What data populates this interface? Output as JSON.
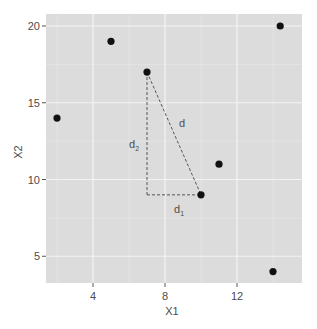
{
  "chart_data": {
    "type": "scatter",
    "title": "",
    "xlabel": "X1",
    "ylabel": "X2",
    "xlim": [
      1.4,
      14.6
    ],
    "ylim": [
      3.4,
      20.8
    ],
    "x_ticks": [
      4,
      8,
      12
    ],
    "y_ticks": [
      5,
      10,
      15,
      20
    ],
    "grid": true,
    "legend": null,
    "points": [
      {
        "x": 2,
        "y": 14
      },
      {
        "x": 5,
        "y": 19
      },
      {
        "x": 7,
        "y": 17
      },
      {
        "x": 10,
        "y": 9
      },
      {
        "x": 11,
        "y": 11
      },
      {
        "x": 14,
        "y": 4
      },
      {
        "x": 14.4,
        "y": 20
      }
    ],
    "annotations": [
      {
        "type": "dashed-line",
        "from": [
          7,
          17
        ],
        "to": [
          10,
          9
        ],
        "label": "d"
      },
      {
        "type": "dashed-line",
        "from": [
          7,
          17
        ],
        "to": [
          7,
          9
        ],
        "label": "d2"
      },
      {
        "type": "dashed-line",
        "from": [
          7,
          9
        ],
        "to": [
          10,
          9
        ],
        "label": "d1"
      }
    ]
  },
  "labels": {
    "x_axis": "X1",
    "y_axis": "X2",
    "x_ticks": [
      "4",
      "8",
      "12"
    ],
    "y_ticks": [
      "5",
      "10",
      "15",
      "20"
    ],
    "d": "d",
    "d1_main": "d",
    "d1_sub": "1",
    "d2_main": "d",
    "d2_sub": "2"
  }
}
